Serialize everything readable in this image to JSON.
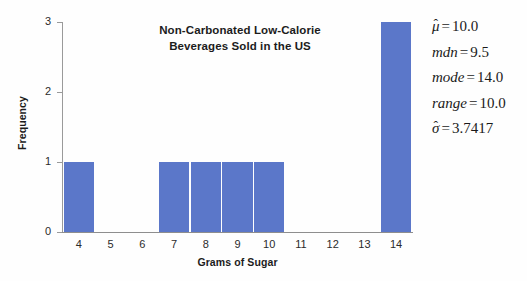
{
  "chart": {
    "title_line1": "Non-Carbonated Low-Calorie",
    "title_line2": "Beverages Sold in the US",
    "xlabel": "Grams of Sugar",
    "ylabel": "Frequency"
  },
  "chart_data": {
    "type": "bar",
    "title": "Non-Carbonated Low-Calorie Beverages Sold in the US",
    "xlabel": "Grams of Sugar",
    "ylabel": "Frequency",
    "categories": [
      "4",
      "5",
      "6",
      "7",
      "8",
      "9",
      "10",
      "11",
      "12",
      "13",
      "14"
    ],
    "values": [
      1,
      0,
      0,
      1,
      1,
      1,
      1,
      0,
      0,
      0,
      3
    ],
    "ylim": [
      0,
      3
    ],
    "yticks": [
      "0",
      "1",
      "2",
      "3"
    ],
    "xticks": [
      "4",
      "5",
      "6",
      "7",
      "8",
      "9",
      "10",
      "11",
      "12",
      "13",
      "14"
    ],
    "grid": false,
    "legend": false,
    "bar_color": "#5b77c9"
  },
  "stats": [
    {
      "symbol": "μ",
      "hat": "ˆ",
      "equals": "=",
      "value": "10.0"
    },
    {
      "symbol": "mdn",
      "hat": "",
      "equals": "=",
      "value": "9.5"
    },
    {
      "symbol": "mode",
      "hat": "",
      "equals": "=",
      "value": "14.0"
    },
    {
      "symbol": "range",
      "hat": "",
      "equals": "=",
      "value": "10.0"
    },
    {
      "symbol": "σ",
      "hat": "ˆ",
      "equals": "=",
      "value": "3.7417"
    }
  ]
}
